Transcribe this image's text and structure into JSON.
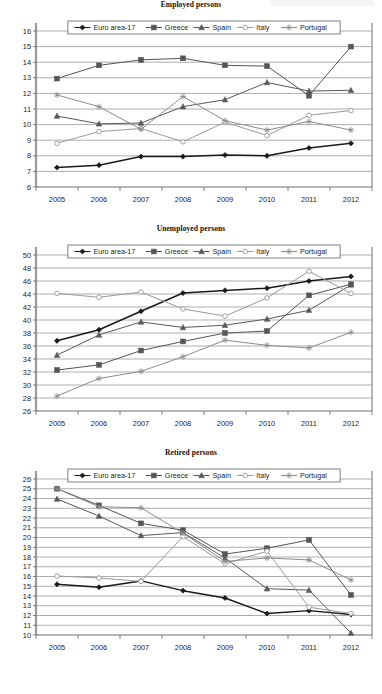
{
  "page": {
    "width": 382,
    "height": 694,
    "background": "#ffffff",
    "series_names": [
      "Euro area-17",
      "Greece",
      "Spain",
      "Italy",
      "Portugal"
    ],
    "series_colors": [
      "#1a1a1a",
      "#555555",
      "#5a5a5a",
      "#9a9a9a",
      "#8c8c8c"
    ],
    "series_markers": [
      "diamond",
      "square",
      "triangle",
      "circle-open",
      "asterisk"
    ]
  },
  "charts": [
    {
      "id": "employed-persons",
      "title": "Employed persons",
      "legend": [
        "Euro area-17",
        "Greece",
        "Spain",
        "Italy",
        "Portugal"
      ],
      "years": [
        "2005",
        "2006",
        "2007",
        "2008",
        "2009",
        "2010",
        "2011",
        "2012"
      ],
      "yticks": [
        "6",
        "7",
        "8",
        "9",
        "10",
        "11",
        "12",
        "13",
        "14",
        "15",
        "16"
      ]
    },
    {
      "id": "unemployed-persons",
      "title": "Unemployed persons",
      "legend": [
        "Euro area-17",
        "Greece",
        "Spain",
        "Italy",
        "Portugal"
      ],
      "years": [
        "2005",
        "2006",
        "2007",
        "2008",
        "2009",
        "2010",
        "2011",
        "2012"
      ],
      "yticks": [
        "26",
        "28",
        "30",
        "32",
        "34",
        "36",
        "38",
        "40",
        "42",
        "44",
        "46",
        "48",
        "50"
      ]
    },
    {
      "id": "retired-persons",
      "title": "Retired persons",
      "legend": [
        "Euro area-17",
        "Greece",
        "Spain",
        "Italy",
        "Portugal"
      ],
      "years": [
        "2005",
        "2006",
        "2007",
        "2008",
        "2009",
        "2010",
        "2011",
        "2012"
      ],
      "yticks": [
        "10",
        "11",
        "12",
        "13",
        "14",
        "15",
        "16",
        "17",
        "18",
        "19",
        "20",
        "21",
        "22",
        "23",
        "24",
        "25",
        "26"
      ]
    }
  ],
  "chart_data": [
    {
      "type": "line",
      "title": "Employed persons",
      "xlabel": "",
      "ylabel": "",
      "x": [
        2005,
        2006,
        2007,
        2008,
        2009,
        2010,
        2011,
        2012
      ],
      "ylim": [
        6,
        16
      ],
      "ytick_step": 1,
      "grid": true,
      "legend_position": "top-inside",
      "series": [
        {
          "name": "Euro area-17",
          "values": [
            7.25,
            7.4,
            7.95,
            7.95,
            8.05,
            8.0,
            8.5,
            8.8
          ]
        },
        {
          "name": "Greece",
          "values": [
            12.95,
            13.8,
            14.15,
            14.25,
            13.8,
            13.75,
            11.85,
            15.0
          ]
        },
        {
          "name": "Spain",
          "values": [
            10.55,
            10.05,
            10.1,
            11.15,
            11.6,
            12.7,
            12.15,
            12.2
          ]
        },
        {
          "name": "Italy",
          "values": [
            8.8,
            9.55,
            9.75,
            8.9,
            10.15,
            9.3,
            10.6,
            10.9
          ]
        },
        {
          "name": "Portugal",
          "values": [
            11.9,
            11.15,
            9.7,
            11.8,
            10.25,
            9.65,
            10.2,
            9.65
          ]
        }
      ]
    },
    {
      "type": "line",
      "title": "Unemployed persons",
      "xlabel": "",
      "ylabel": "",
      "x": [
        2005,
        2006,
        2007,
        2008,
        2009,
        2010,
        2011,
        2012
      ],
      "ylim": [
        26,
        50
      ],
      "ytick_step": 2,
      "grid": true,
      "legend_position": "top-inside",
      "series": [
        {
          "name": "Euro area-17",
          "values": [
            36.8,
            38.5,
            41.35,
            44.15,
            44.55,
            44.9,
            46.0,
            46.7
          ]
        },
        {
          "name": "Greece",
          "values": [
            32.3,
            33.1,
            35.3,
            36.7,
            38.0,
            38.3,
            43.8,
            45.5
          ]
        },
        {
          "name": "Spain",
          "values": [
            34.6,
            37.7,
            39.7,
            38.85,
            39.2,
            40.15,
            41.5,
            45.4
          ]
        },
        {
          "name": "Italy",
          "values": [
            44.1,
            43.5,
            44.3,
            41.7,
            40.6,
            43.4,
            47.5,
            44.1
          ]
        },
        {
          "name": "Portugal",
          "values": [
            28.3,
            31.0,
            32.1,
            34.35,
            36.9,
            36.1,
            35.7,
            38.1
          ]
        }
      ]
    },
    {
      "type": "line",
      "title": "Retired persons",
      "xlabel": "",
      "ylabel": "",
      "x": [
        2005,
        2006,
        2007,
        2008,
        2009,
        2010,
        2011,
        2012
      ],
      "ylim": [
        10,
        26
      ],
      "ytick_step": 1,
      "grid": true,
      "legend_position": "top-inside",
      "series": [
        {
          "name": "Euro area-17",
          "values": [
            15.2,
            14.9,
            15.55,
            14.55,
            13.8,
            12.2,
            12.5,
            12.1
          ]
        },
        {
          "name": "Greece",
          "values": [
            25.0,
            23.3,
            21.45,
            20.75,
            18.3,
            18.9,
            19.75,
            14.1
          ]
        },
        {
          "name": "Spain",
          "values": [
            23.95,
            22.2,
            20.2,
            20.5,
            17.9,
            14.75,
            14.6,
            10.2
          ]
        },
        {
          "name": "Italy",
          "values": [
            16.05,
            15.85,
            15.5,
            20.1,
            17.3,
            18.6,
            12.85,
            12.2
          ]
        },
        {
          "name": "Portugal",
          "values": [
            25.0,
            23.15,
            23.05,
            20.45,
            17.55,
            17.9,
            17.7,
            15.65
          ]
        }
      ]
    }
  ]
}
